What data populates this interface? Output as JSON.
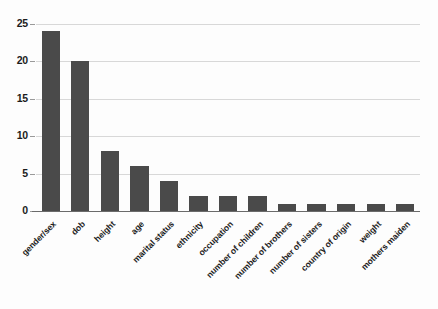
{
  "chart_data": {
    "type": "bar",
    "title": "",
    "subtitle": "",
    "xlabel": "",
    "ylabel": "",
    "ylim": [
      0,
      25
    ],
    "yticks": [
      0,
      5,
      10,
      15,
      20,
      25
    ],
    "ytick_labels": [
      "0",
      "5",
      "10",
      "15",
      "20",
      "25"
    ],
    "grid": true,
    "grid_axis": "y",
    "legend": false,
    "legend_position": "none",
    "orientation": "vertical",
    "bar_color": "#4a4a4a",
    "background_color": "#fdfdfd",
    "gridline_color": "#d8d8d8",
    "axis_color": "#6b6b6b",
    "text_color": "#1c1c1c",
    "xtick_rotation": -45,
    "categories": [
      "gender/sex",
      "dob",
      "height",
      "age",
      "marital status",
      "ethnicity",
      "occupation",
      "number of children",
      "number of brothers",
      "number of sisters",
      "country of origin",
      "weight",
      "mothers maiden"
    ],
    "values": [
      24,
      20,
      8,
      6,
      4,
      2,
      2,
      2,
      1,
      1,
      1,
      1,
      1
    ],
    "series": [
      {
        "name": "count",
        "values": [
          24,
          20,
          8,
          6,
          4,
          2,
          2,
          2,
          1,
          1,
          1,
          1,
          1
        ]
      }
    ]
  }
}
